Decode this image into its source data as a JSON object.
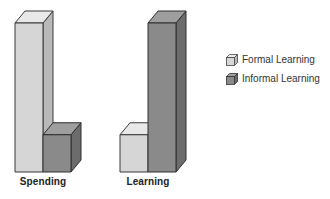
{
  "chart_data": {
    "type": "bar",
    "style": "3d-column",
    "title": "",
    "xlabel": "",
    "ylabel": "",
    "categories": [
      "Spending",
      "Learning"
    ],
    "series": [
      {
        "name": "Formal Learning",
        "values": [
          80,
          20
        ],
        "color": "#d6d6d6"
      },
      {
        "name": "Informal Learning",
        "values": [
          20,
          80
        ],
        "color": "#8a8a8a"
      }
    ],
    "ylim": [
      0,
      100
    ],
    "grid": false,
    "axes_visible": false,
    "legend_position": "right",
    "note": "Values are relative (no axis shown); approx 80/20 split estimated from bar heights"
  },
  "legend": {
    "items": [
      {
        "label": "Formal Learning"
      },
      {
        "label": "Informal Learning"
      }
    ]
  },
  "labels": {
    "spending": "Spending",
    "learning": "Learning"
  }
}
